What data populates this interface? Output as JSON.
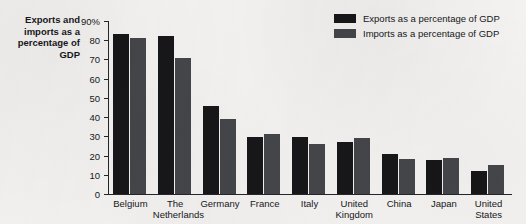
{
  "chart_data": {
    "type": "bar",
    "title": "",
    "xlabel": "",
    "ylabel": "Exports and imports as a percentage of GDP",
    "ylim": [
      0,
      90
    ],
    "ytick_values": [
      0,
      10,
      20,
      30,
      40,
      50,
      60,
      70,
      80,
      90
    ],
    "ytick_labels": [
      "0",
      "10",
      "20",
      "30",
      "40",
      "50",
      "60",
      "70",
      "80",
      "90%"
    ],
    "grid": false,
    "legend_position": "top-right",
    "categories": [
      "Belgium",
      "The\nNetherlands",
      "Germany",
      "France",
      "Italy",
      "United\nKingdom",
      "China",
      "Japan",
      "United\nStates"
    ],
    "series": [
      {
        "name": "Exports as a percentage of GDP",
        "color": "#17171a",
        "values": [
          83,
          82,
          46,
          29.5,
          29.5,
          27,
          21,
          17.5,
          12
        ]
      },
      {
        "name": "Imports as a percentage of GDP",
        "color": "#45464a",
        "values": [
          81,
          71,
          39,
          31,
          26,
          29,
          18,
          18.5,
          15
        ]
      }
    ]
  },
  "axis_title": {
    "text": "Exports and\nimports as a\npercentage of\nGDP"
  },
  "legend": {
    "items": [
      {
        "label": "Exports as a percentage of GDP",
        "color": "#17171a"
      },
      {
        "label": "Imports as a percentage of GDP",
        "color": "#45464a"
      }
    ]
  }
}
